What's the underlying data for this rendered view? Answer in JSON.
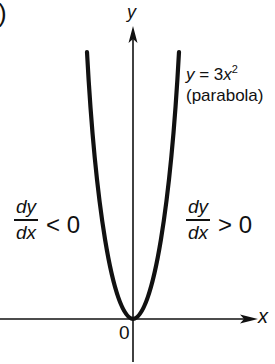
{
  "figure": {
    "panel_marker": ")",
    "axes": {
      "y_label": "y",
      "x_label": "x",
      "origin_label": "0"
    },
    "curve": {
      "equation_prefix": "y = 3",
      "equation_var": "x",
      "equation_exp": "2",
      "name": "(parabola)"
    },
    "left_region": {
      "numerator": "dy",
      "denominator": "dx",
      "relation": "< 0"
    },
    "right_region": {
      "numerator": "dy",
      "denominator": "dx",
      "relation": "> 0"
    },
    "colors": {
      "ink": "#111111",
      "background": "#ffffff"
    }
  }
}
